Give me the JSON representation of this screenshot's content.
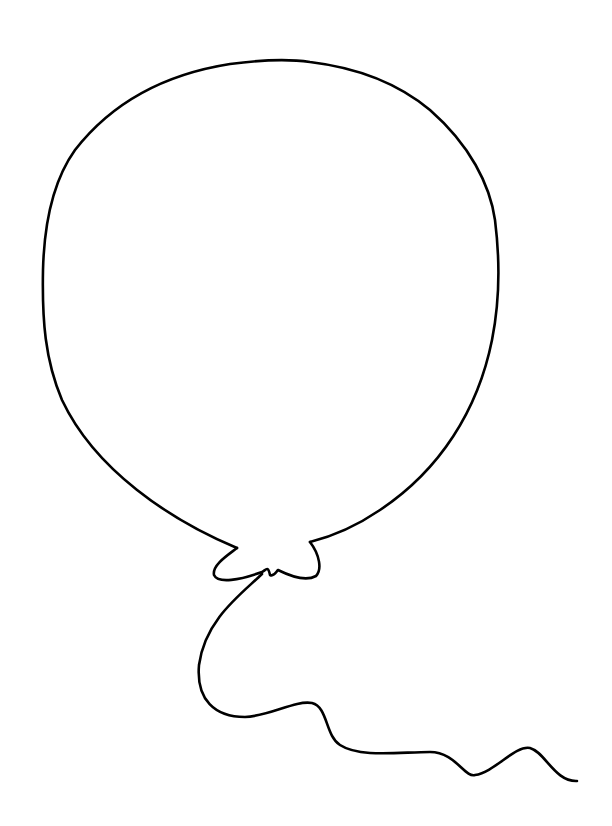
{
  "image": {
    "subject": "balloon outline drawing",
    "style": "black line art on white background",
    "colors": {
      "background": "#ffffff",
      "line": "#000000"
    }
  }
}
